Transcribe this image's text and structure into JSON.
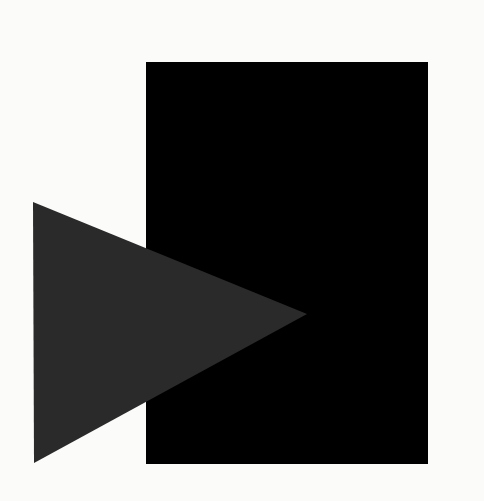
{
  "artwork": {
    "background_color": "#fbfbfa",
    "rectangle": {
      "x": 146,
      "y": 62,
      "width": 282,
      "height": 402,
      "color": "#000000"
    },
    "triangle": {
      "points": [
        [
          33,
          202
        ],
        [
          307,
          314
        ],
        [
          34,
          463
        ]
      ],
      "color": "#2a2a2a"
    }
  }
}
